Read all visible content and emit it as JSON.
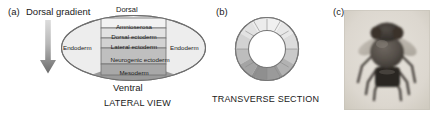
{
  "figure": {
    "panels": [
      {
        "letter": "(a)",
        "title": "Dorsal gradient",
        "caption": "LATERAL VIEW",
        "top_label": "Dorsal",
        "bottom_label": "Ventral",
        "left_label": "Endoderm",
        "right_label": "Endoderm",
        "arrow": {
          "name": "dorsal-gradient-arrow",
          "direction": "down",
          "color_top": "#d4d4d4",
          "color_bottom": "#6e6e6e"
        },
        "bands": [
          {
            "label": "Amnioserosa",
            "fill": "#f2f2f2"
          },
          {
            "label": "Dorsal ectoderm",
            "fill": "#e2e2e2"
          },
          {
            "label": "Lateral ectoderm",
            "fill": "#d2d2d2"
          },
          {
            "label": "Neurogenic ectoderm",
            "fill": "#bfbfbf"
          },
          {
            "label": "Mesoderm",
            "fill": "#a8a8a8"
          }
        ],
        "ellipse_fill": "#ededed",
        "ventral_furrow_fill": "#9a9a9a"
      },
      {
        "letter": "(b)",
        "caption": "TRANSVERSE SECTION",
        "ring": {
          "name": "transverse-section-ring",
          "segment_count": 12,
          "segment_fills": [
            "#f0f0f0",
            "#eaeaea",
            "#e2e2e2",
            "#d8d8d8",
            "#cccccc",
            "#bdbdbd",
            "#ababab",
            "#9d9d9d",
            "#8f8f8f",
            "#a4a4a4",
            "#c2c2c2",
            "#dcdcdc"
          ],
          "outer_stroke": "#777777",
          "inner_fill": "#ffffff"
        }
      },
      {
        "letter": "(c)",
        "photo": {
          "name": "drosophila-fly-photo",
          "subject": "fruit fly",
          "background": "#ded9d2",
          "body_color": "#3b3632"
        }
      }
    ]
  }
}
